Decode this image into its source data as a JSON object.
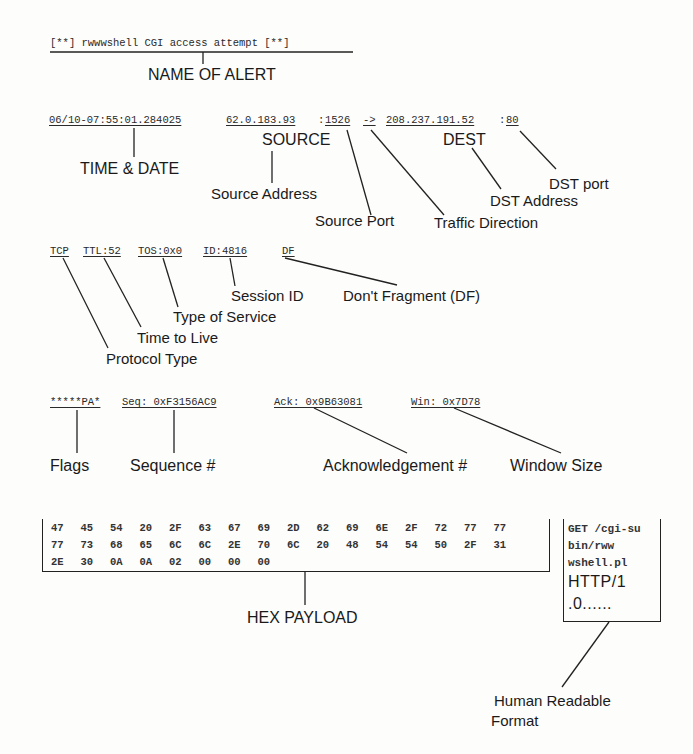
{
  "alert": {
    "text": "[**] rwwwshell CGI access attempt [**]",
    "label": "NAME OF ALERT"
  },
  "header_line": {
    "timestamp": "06/10-07:55:01.284025",
    "source_ip": "62.0.183.93",
    "colon1": ":",
    "source_port": "1526",
    "direction": "->",
    "dest_ip": "208.237.191.52",
    "colon2": ":",
    "dest_port": "80"
  },
  "header_labels": {
    "time_date": "TIME & DATE",
    "source": "SOURCE",
    "dest": "DEST",
    "source_address": "Source Address",
    "source_port": "Source Port",
    "traffic_direction": "Traffic Direction",
    "dst_address": "DST Address",
    "dst_port": "DST port"
  },
  "ip_line": {
    "protocol": "TCP",
    "ttl": "TTL:52",
    "tos": "TOS:0x0",
    "id": "ID:4816",
    "df": "DF"
  },
  "ip_labels": {
    "session_id": "Session ID",
    "dont_fragment": "Don't Fragment (DF)",
    "type_of_service": "Type of Service",
    "time_to_live": "Time to Live",
    "protocol_type": "Protocol Type"
  },
  "tcp_line": {
    "flags": "*****PA*",
    "seq": "Seq: 0xF3156AC9",
    "ack": "Ack: 0x9B63081",
    "win": "Win: 0x7D78"
  },
  "tcp_labels": {
    "flags": "Flags",
    "sequence": "Sequence #",
    "acknowledgement": "Acknowledgement #",
    "window_size": "Window Size"
  },
  "payload": {
    "hex_rows": [
      [
        "47",
        "45",
        "54",
        "20",
        "2F",
        "63",
        "67",
        "69",
        "2D",
        "62",
        "69",
        "6E",
        "2F",
        "72",
        "77",
        "77"
      ],
      [
        "77",
        "73",
        "68",
        "65",
        "6C",
        "6C",
        "2E",
        "70",
        "6C",
        "20",
        "48",
        "54",
        "54",
        "50",
        "2F",
        "31"
      ],
      [
        "2E",
        "30",
        "0A",
        "0A",
        "02",
        "00",
        "00",
        "00"
      ]
    ],
    "ascii_lines": [
      "GET /cgi-su",
      "bin/rww",
      "wshell.pl",
      "HTTP/1",
      ".0......"
    ],
    "hex_label": "HEX PAYLOAD",
    "ascii_label_1": "Human Readable",
    "ascii_label_2": "Format"
  }
}
